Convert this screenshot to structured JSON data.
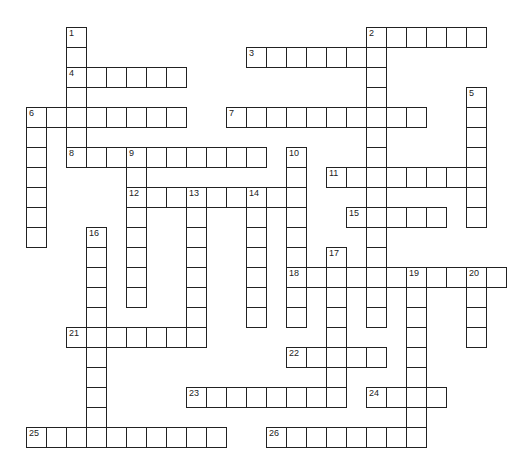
{
  "puzzle": {
    "type": "crossword",
    "cell_size": 20,
    "origin": {
      "x": 7,
      "y": 8
    },
    "entries": [
      {
        "number": "1",
        "direction": "down",
        "row": 1,
        "col": 3,
        "length": 6
      },
      {
        "number": "2",
        "direction": "across",
        "row": 1,
        "col": 18,
        "length": 6
      },
      {
        "number": "2",
        "direction": "down",
        "row": 1,
        "col": 18,
        "length": 15
      },
      {
        "number": "3",
        "direction": "across",
        "row": 2,
        "col": 12,
        "length": 7
      },
      {
        "number": "4",
        "direction": "across",
        "row": 3,
        "col": 3,
        "length": 6
      },
      {
        "number": "5",
        "direction": "down",
        "row": 4,
        "col": 23,
        "length": 7
      },
      {
        "number": "6",
        "direction": "across",
        "row": 5,
        "col": 1,
        "length": 8
      },
      {
        "number": "6",
        "direction": "down",
        "row": 5,
        "col": 1,
        "length": 7
      },
      {
        "number": "7",
        "direction": "across",
        "row": 5,
        "col": 11,
        "length": 10
      },
      {
        "number": "8",
        "direction": "across",
        "row": 7,
        "col": 3,
        "length": 10
      },
      {
        "number": "9",
        "direction": "down",
        "row": 7,
        "col": 6,
        "length": 8
      },
      {
        "number": "10",
        "direction": "down",
        "row": 7,
        "col": 14,
        "length": 9
      },
      {
        "number": "11",
        "direction": "across",
        "row": 8,
        "col": 16,
        "length": 8
      },
      {
        "number": "12",
        "direction": "across",
        "row": 9,
        "col": 6,
        "length": 9
      },
      {
        "number": "13",
        "direction": "down",
        "row": 9,
        "col": 9,
        "length": 8
      },
      {
        "number": "14",
        "direction": "down",
        "row": 9,
        "col": 12,
        "length": 7
      },
      {
        "number": "15",
        "direction": "across",
        "row": 10,
        "col": 17,
        "length": 5
      },
      {
        "number": "16",
        "direction": "down",
        "row": 11,
        "col": 4,
        "length": 11
      },
      {
        "number": "17",
        "direction": "down",
        "row": 12,
        "col": 16,
        "length": 8
      },
      {
        "number": "18",
        "direction": "across",
        "row": 13,
        "col": 14,
        "length": 11
      },
      {
        "number": "19",
        "direction": "down",
        "row": 13,
        "col": 20,
        "length": 9
      },
      {
        "number": "20",
        "direction": "down",
        "row": 13,
        "col": 23,
        "length": 4
      },
      {
        "number": "21",
        "direction": "across",
        "row": 16,
        "col": 3,
        "length": 7
      },
      {
        "number": "22",
        "direction": "across",
        "row": 17,
        "col": 14,
        "length": 5
      },
      {
        "number": "23",
        "direction": "across",
        "row": 19,
        "col": 9,
        "length": 8
      },
      {
        "number": "24",
        "direction": "across",
        "row": 19,
        "col": 18,
        "length": 4
      },
      {
        "number": "25",
        "direction": "across",
        "row": 21,
        "col": 1,
        "length": 10
      },
      {
        "number": "26",
        "direction": "across",
        "row": 21,
        "col": 13,
        "length": 8
      }
    ]
  },
  "colors": {
    "line": "#222222",
    "cell": "#ffffff",
    "background": "#ffffff"
  }
}
